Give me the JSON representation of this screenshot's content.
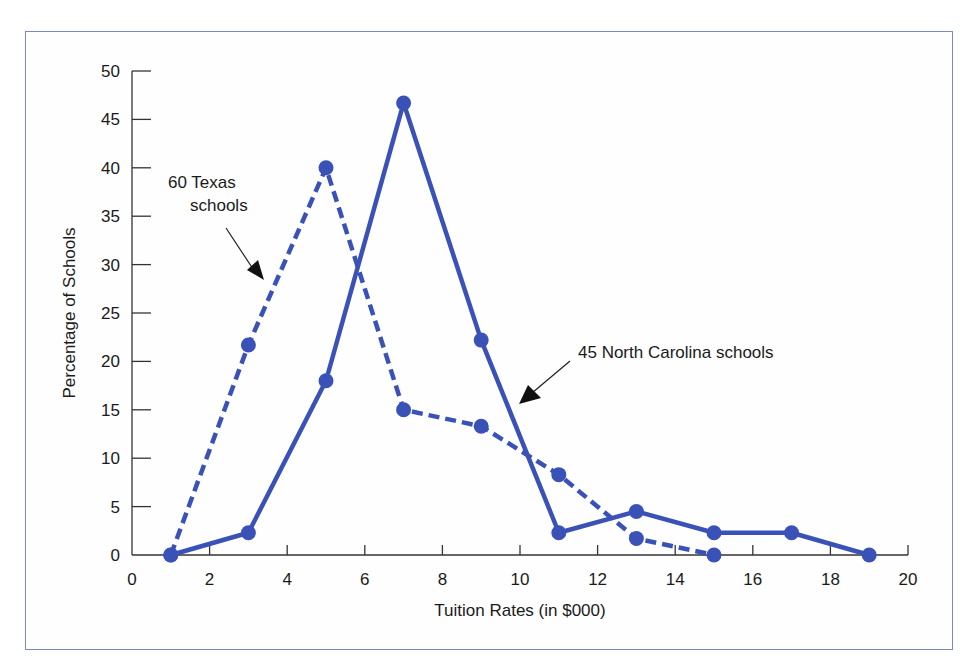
{
  "chart_data": {
    "type": "line",
    "title": "",
    "xlabel": "Tuition Rates (in $000)",
    "ylabel": "Percentage of Schools",
    "xlim": [
      0,
      20
    ],
    "ylim": [
      0,
      50
    ],
    "x_ticks": [
      0,
      2,
      4,
      6,
      8,
      10,
      12,
      14,
      16,
      18,
      20
    ],
    "y_ticks": [
      0,
      5,
      10,
      15,
      20,
      25,
      30,
      35,
      40,
      45,
      50
    ],
    "grid": false,
    "legend": "none (inline annotations with arrows)",
    "series": [
      {
        "name": "60 Texas schools",
        "style": "dashed",
        "color": "#3a52b8",
        "x": [
          1,
          3,
          5,
          7,
          9,
          11,
          13,
          15
        ],
        "values": [
          0,
          21.7,
          40,
          15,
          13.3,
          8.3,
          1.7,
          0
        ]
      },
      {
        "name": "45 North Carolina schools",
        "style": "solid",
        "color": "#3a52b8",
        "x": [
          1,
          3,
          5,
          7,
          9,
          11,
          13,
          15,
          17,
          19
        ],
        "values": [
          0,
          2.3,
          18,
          46.7,
          22.2,
          2.3,
          4.5,
          2.3,
          2.3,
          0
        ]
      }
    ],
    "annotations": [
      {
        "text_line1": "60 Texas",
        "text_line2": "schools",
        "points_to": "60 Texas schools"
      },
      {
        "text": "45 North Carolina schools",
        "points_to": "45 North Carolina schools"
      }
    ]
  },
  "labels": {
    "xlabel": "Tuition Rates (in $000)",
    "ylabel": "Percentage of Schools",
    "texas_line1": "60 Texas",
    "texas_line2": "schools",
    "nc": "45 North Carolina schools"
  },
  "colors": {
    "series": "#3a52b8",
    "frame": "#7d86c6",
    "axis": "#333333"
  }
}
